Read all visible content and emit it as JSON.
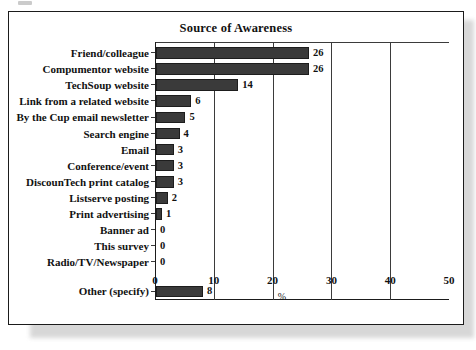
{
  "figure": {
    "title": "Source of Awareness"
  },
  "chart_data": {
    "type": "bar",
    "orientation": "horizontal",
    "title": "Source of Awareness",
    "xlabel": "%",
    "ylabel": "",
    "xlim": [
      0,
      50
    ],
    "xticks": [
      0,
      10,
      20,
      30,
      40,
      50
    ],
    "grid": true,
    "grid_axis": "x",
    "legend": false,
    "bar_color": "#3a3a3a",
    "categories": [
      "Friend/colleague",
      "Compumentor website",
      "TechSoup website",
      "Link from a related website",
      "By the Cup email newsletter",
      "Search engine",
      "Email",
      "Conference/event",
      "DiscounTech print catalog",
      "Listserve posting",
      "Print advertising",
      "Banner ad",
      "This survey",
      "Radio/TV/Newspaper",
      "Other (specify)"
    ],
    "values": [
      26,
      26,
      14,
      6,
      5,
      4,
      3,
      3,
      3,
      2,
      1,
      0,
      0,
      0,
      8
    ],
    "data_labels": [
      "26",
      "26",
      "14",
      "6",
      "5",
      "4",
      "3",
      "3",
      "3",
      "2",
      "1",
      "0",
      "0",
      "0",
      "8"
    ]
  }
}
